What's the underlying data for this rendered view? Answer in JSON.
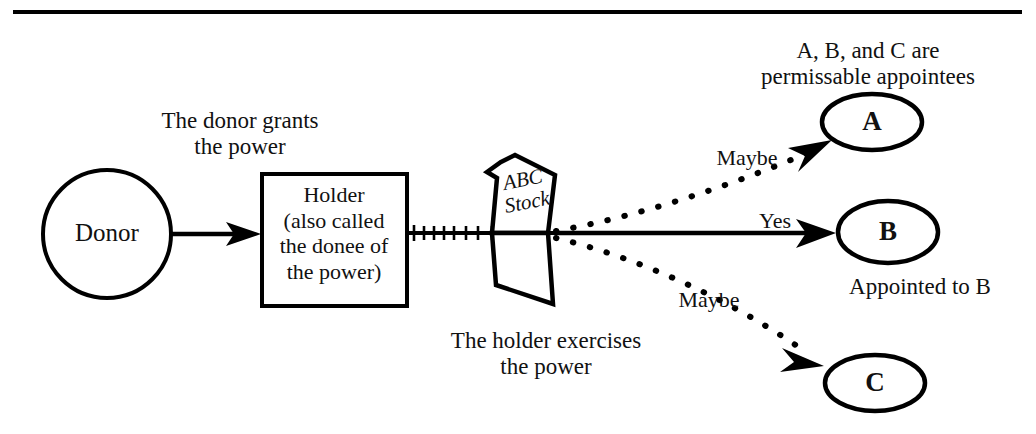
{
  "diagram": {
    "title_rule": "horizontal-rule",
    "nodes": {
      "donor": {
        "label": "Donor",
        "shape": "circle"
      },
      "holder": {
        "label": "Holder\n(also called\nthe donee of\nthe power)",
        "shape": "rectangle"
      },
      "document": {
        "label": "ABC\nStock",
        "shape": "torn-document"
      },
      "a": {
        "label": "A",
        "shape": "ellipse"
      },
      "b": {
        "label": "B",
        "shape": "ellipse"
      },
      "c": {
        "label": "C",
        "shape": "ellipse"
      }
    },
    "captions": {
      "grant": "The donor grants\nthe power",
      "exercise": "The holder exercises\nthe power",
      "appointees": "A, B, and C are\npermissable appointees",
      "appointed": "Appointed to B"
    },
    "edges": {
      "donor_to_holder": {
        "label": "",
        "style": "solid-arrow"
      },
      "holder_to_b": {
        "label": "Yes",
        "style": "solid-arrow"
      },
      "to_a": {
        "label": "Maybe",
        "style": "dotted-arrow"
      },
      "to_c": {
        "label": "Maybe",
        "style": "dotted-arrow"
      }
    },
    "colors": {
      "ink": "#000000",
      "paper": "#ffffff"
    }
  }
}
